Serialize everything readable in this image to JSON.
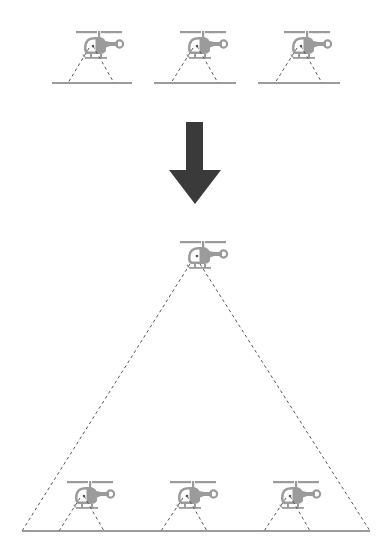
{
  "figure": {
    "colors": {
      "background": "#ffffff",
      "helicopter": "#9b9b9b",
      "ground_line": "#7a7a7a",
      "fov_dash": "#555555",
      "arrow": "#3a3a3a"
    }
  },
  "top_panel": {
    "label": "low-altitude-coverage",
    "helicopters": [
      {
        "id": "heli-top-1",
        "x": 76,
        "y": 31
      },
      {
        "id": "heli-top-2",
        "x": 180,
        "y": 31
      },
      {
        "id": "heli-top-3",
        "x": 284,
        "y": 31
      }
    ],
    "ground_segments": [
      {
        "x1": 52,
        "x2": 132,
        "y": 83
      },
      {
        "x1": 154,
        "x2": 236,
        "y": 83
      },
      {
        "x1": 258,
        "x2": 340,
        "y": 83
      }
    ],
    "fov": [
      {
        "apex_l": [
          88,
          56
        ],
        "apex_r": [
          99,
          56
        ],
        "base_l": 68,
        "base_r": 114,
        "base_y": 83
      },
      {
        "apex_l": [
          192,
          56
        ],
        "apex_r": [
          203,
          56
        ],
        "base_l": 171,
        "base_r": 218,
        "base_y": 83
      },
      {
        "apex_l": [
          296,
          56
        ],
        "apex_r": [
          307,
          56
        ],
        "base_l": 275,
        "base_r": 322,
        "base_y": 83
      }
    ]
  },
  "arrow": {
    "direction": "down",
    "shaft": {
      "x": 186,
      "y": 122,
      "w": 17,
      "h": 48
    },
    "head": {
      "left": 169,
      "right": 221,
      "y": 170,
      "tip_x": 195,
      "tip_y": 204
    }
  },
  "bottom_panel": {
    "label": "high-altitude-coverage",
    "high_helicopter": {
      "id": "heli-high",
      "x": 180,
      "y": 241
    },
    "wide_fov": {
      "apex_l": [
        189,
        266
      ],
      "apex_r": [
        203,
        266
      ],
      "base_l": 22,
      "base_r": 370,
      "base_y": 531
    },
    "ground_line": {
      "x1": 22,
      "x2": 370,
      "y": 531
    },
    "helicopters": [
      {
        "id": "heli-bottom-1",
        "x": 67,
        "y": 481
      },
      {
        "id": "heli-bottom-2",
        "x": 170,
        "y": 481
      },
      {
        "id": "heli-bottom-3",
        "x": 273,
        "y": 481
      }
    ],
    "fov": [
      {
        "apex_l": [
          79,
          506
        ],
        "apex_r": [
          90,
          506
        ],
        "base_l": 59,
        "base_r": 104,
        "base_y": 531
      },
      {
        "apex_l": [
          182,
          506
        ],
        "apex_r": [
          193,
          506
        ],
        "base_l": 161,
        "base_r": 207,
        "base_y": 531
      },
      {
        "apex_l": [
          285,
          506
        ],
        "apex_r": [
          296,
          506
        ],
        "base_l": 264,
        "base_r": 310,
        "base_y": 531
      }
    ]
  }
}
